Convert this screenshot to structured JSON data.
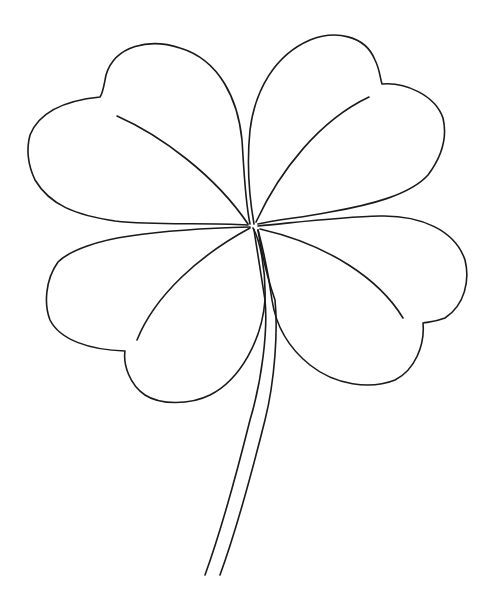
{
  "image": {
    "subject": "four-leaf clover line drawing",
    "background_color": "#ffffff",
    "line_color": "#1a1a1a",
    "leaves": [
      {
        "name": "top-left-leaf"
      },
      {
        "name": "top-right-leaf"
      },
      {
        "name": "bottom-left-leaf"
      },
      {
        "name": "bottom-right-leaf"
      }
    ],
    "stem": {
      "name": "stem"
    }
  }
}
